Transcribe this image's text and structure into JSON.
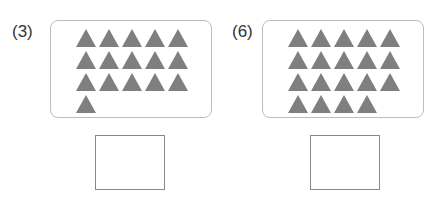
{
  "problems": [
    {
      "label": "(3)",
      "triangle_count": 16,
      "rows": [
        5,
        5,
        5,
        1
      ],
      "answer": ""
    },
    {
      "label": "(6)",
      "triangle_count": 19,
      "rows": [
        5,
        5,
        5,
        4
      ],
      "answer": ""
    }
  ],
  "colors": {
    "triangle": "#7f7f7f",
    "panel_border": "#bdbdbd",
    "answer_border": "#888888"
  }
}
